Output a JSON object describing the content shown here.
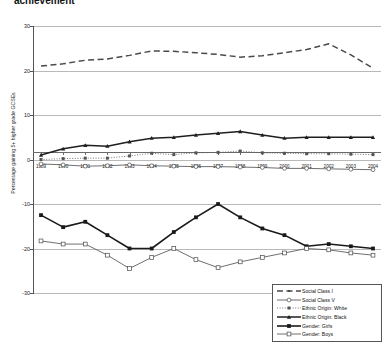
{
  "chart_title": "achievement",
  "axis": {
    "ylabel": "Percentage gaining 5+ higher grade GCSEs",
    "yticks": [
      "30",
      "20",
      "10",
      "0",
      "-10",
      "-20",
      "-30"
    ],
    "xticks": [
      "1989",
      "1990",
      "1991",
      "1992",
      "1993",
      "1994",
      "1995",
      "1996",
      "1997",
      "1998",
      "1999",
      "2000",
      "2001",
      "2002",
      "2003",
      "2004"
    ]
  },
  "legend": {
    "items": [
      {
        "label": "Social Class I",
        "symbol": "dashed-line-with-marker",
        "color": "#4a4a4a"
      },
      {
        "label": "Social Class V",
        "symbol": "solid-line-with-circle",
        "color": "#4a4a4a"
      },
      {
        "label": "Ethnic Origin: White",
        "symbol": "dotted-line-with-square",
        "color": "#555555"
      },
      {
        "label": "Ethnic Origin: Black",
        "symbol": "solid-line-with-triangle",
        "color": "#4a4a4a"
      },
      {
        "label": "Gender: Girls",
        "symbol": "bold-line-with-filled-square",
        "color": "#1a1a1a"
      },
      {
        "label": "Gender: Boys",
        "symbol": "solid-line-with-open-square",
        "color": "#4a4a4a"
      }
    ]
  },
  "chart_data": {
    "type": "line",
    "title": "achievement",
    "xlabel": "",
    "ylabel": "Percentage gaining 5+ higher grade GCSEs",
    "ylim": [
      -30,
      30
    ],
    "grid": true,
    "legend_position": "bottom-right",
    "categories": [
      "1989",
      "1990",
      "1991",
      "1992",
      "1993",
      "1994",
      "1995",
      "1996",
      "1997",
      "1998",
      "1999",
      "2000",
      "2001",
      "2002",
      "2003",
      "2004"
    ],
    "series": [
      {
        "name": "Social Class I",
        "style": "dashed",
        "values": [
          21.0,
          21.5,
          22.3,
          22.6,
          23.4,
          24.4,
          24.3,
          24.0,
          23.6,
          23.0,
          23.3,
          24.0,
          24.7,
          26.0,
          23.5,
          20.5
        ]
      },
      {
        "name": "Social Class V",
        "style": "solid",
        "values": [
          -1.0,
          -1.2,
          -1.5,
          -1.4,
          -1.2,
          -1.4,
          -1.5,
          -1.6,
          -1.6,
          -1.7,
          -1.8,
          -2.0,
          -2.0,
          -2.1,
          -2.2,
          -2.3
        ]
      },
      {
        "name": "Ethnic Origin: White",
        "style": "dotted",
        "values": [
          0.0,
          0.2,
          0.3,
          0.3,
          0.8,
          1.4,
          1.1,
          1.5,
          1.6,
          1.9,
          1.5,
          1.4,
          1.3,
          1.3,
          1.2,
          1.1
        ]
      },
      {
        "name": "Ethnic Origin: Black",
        "style": "solid",
        "values": [
          1.0,
          2.4,
          3.2,
          3.0,
          4.0,
          4.8,
          5.0,
          5.5,
          5.9,
          6.3,
          5.5,
          4.8,
          5.0,
          5.0,
          5.0,
          5.0
        ]
      },
      {
        "name": "Gender: Girls",
        "style": "bold-solid",
        "values": [
          -12.5,
          -15.2,
          -14.0,
          -17.0,
          -20.0,
          -20.0,
          -16.3,
          -13.0,
          -10.0,
          -13.0,
          -15.5,
          -17.0,
          -19.5,
          -19.0,
          -19.5,
          -20.0
        ]
      },
      {
        "name": "Gender: Boys",
        "style": "solid",
        "values": [
          -18.3,
          -19.0,
          -19.0,
          -21.5,
          -24.5,
          -22.0,
          -20.0,
          -22.5,
          -24.3,
          -23.0,
          -22.0,
          -21.0,
          -20.0,
          -20.3,
          -21.0,
          -21.5
        ]
      }
    ]
  }
}
